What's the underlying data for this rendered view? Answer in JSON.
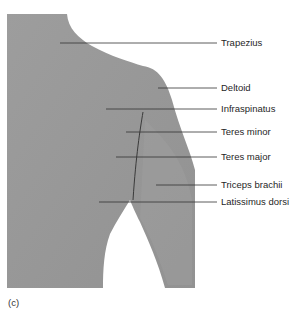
{
  "figure": {
    "panel_letter": "(c)",
    "colors": {
      "skin": "#9a9a9a",
      "skin_shadow": "#8c8c8c",
      "leader_line": "#333333",
      "background": "#ffffff"
    }
  },
  "labels": [
    {
      "text": "Trapezius",
      "y": 43,
      "line_start_x": 60
    },
    {
      "text": "Deltoid",
      "y": 88,
      "line_start_x": 158
    },
    {
      "text": "Infraspinatus",
      "y": 109,
      "line_start_x": 106
    },
    {
      "text": "Teres minor",
      "y": 132,
      "line_start_x": 126
    },
    {
      "text": "Teres major",
      "y": 157,
      "line_start_x": 116
    },
    {
      "text": "Triceps brachii",
      "y": 185,
      "line_start_x": 156
    },
    {
      "text": "Latissimus dorsi",
      "y": 202,
      "line_start_x": 99
    }
  ]
}
